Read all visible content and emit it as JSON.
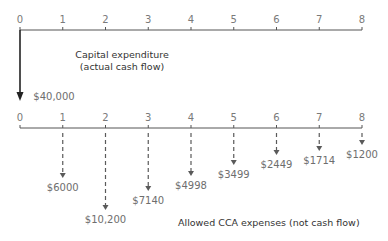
{
  "chart_data": {
    "type": "cash-flow-diagram",
    "top_axis": {
      "ticks": [
        "0",
        "1",
        "2",
        "3",
        "4",
        "5",
        "6",
        "7",
        "8"
      ],
      "caption_line1": "Capital expenditure",
      "caption_line2": "(actual cash flow)",
      "flows": [
        {
          "period": 0,
          "amount": 40000,
          "label": "$40,000",
          "style": "solid"
        }
      ]
    },
    "bottom_axis": {
      "ticks": [
        "0",
        "1",
        "2",
        "3",
        "4",
        "5",
        "6",
        "7",
        "8"
      ],
      "caption": "Allowed CCA expenses (not cash flow)",
      "flows": [
        {
          "period": 1,
          "amount": 6000,
          "label": "$6000",
          "style": "dashed"
        },
        {
          "period": 2,
          "amount": 10200,
          "label": "$10,200",
          "style": "dashed"
        },
        {
          "period": 3,
          "amount": 7140,
          "label": "$7140",
          "style": "dashed"
        },
        {
          "period": 4,
          "amount": 4998,
          "label": "$4998",
          "style": "dashed"
        },
        {
          "period": 5,
          "amount": 3499,
          "label": "$3499",
          "style": "dashed"
        },
        {
          "period": 6,
          "amount": 2449,
          "label": "$2449",
          "style": "dashed"
        },
        {
          "period": 7,
          "amount": 1714,
          "label": "$1714",
          "style": "dashed"
        },
        {
          "period": 8,
          "amount": 1200,
          "label": "$1200",
          "style": "dashed"
        }
      ]
    }
  },
  "colors": {
    "axis": "#555555",
    "arrow_solid": "#222222",
    "arrow_dashed": "#5a5a5a",
    "text": "#6e6e6e"
  }
}
